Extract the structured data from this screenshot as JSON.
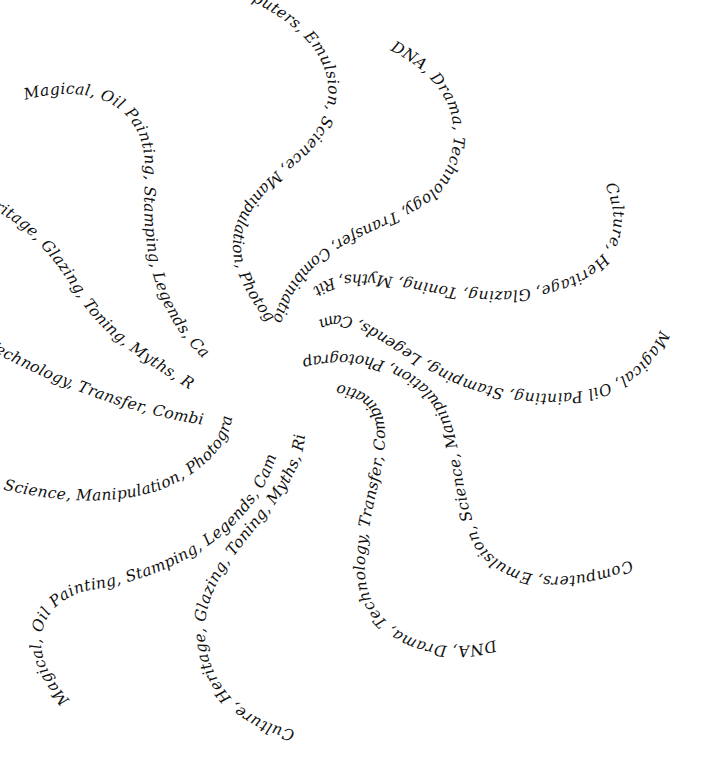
{
  "canvas": {
    "width": 710,
    "height": 758,
    "background": "#ffffff",
    "ink": "#111111"
  },
  "phrases": {
    "computers": "Computers, Emulsion, Science, Manipulation, Photographs, Cells",
    "dna": "DNA, Drama, Technology, Transfer, Combinations",
    "culture": "Culture, Heritage, Glazing, Toning, Myths, Rituals,",
    "magical": "Magical, Oil Painting, Stamping, Legends, Cameras"
  },
  "arms": [
    {
      "id": "top-computers",
      "text": "Computers, Emulsion, Science, Manipulation, Photographs, Cells"
    },
    {
      "id": "top-right-dna",
      "text": "DNA, Drama, Technology, Transfer, Combinations"
    },
    {
      "id": "right-culture",
      "text": "Culture, Heritage, Glazing, Toning, Myths, Rituals,"
    },
    {
      "id": "right-magical",
      "text": "Magical, Oil Painting, Stamping, Legends, Cameras"
    },
    {
      "id": "bottom-right-computers",
      "text": "Computers, Emulsion, Science, Manipulation, Photographs, Cells"
    },
    {
      "id": "bottom-dna",
      "text": "DNA, Drama, Technology, Transfer, Combinations"
    },
    {
      "id": "bottom-culture",
      "text": "Culture, Heritage, Glazing, Toning, Myths, Rituals,"
    },
    {
      "id": "bottom-left-magical",
      "text": "Magical, Oil Painting, Stamping, Legends, Cameras"
    },
    {
      "id": "left-computers",
      "text": "Computers, Emulsion, Science, Manipulation, Photographs, Cells"
    },
    {
      "id": "left-dna",
      "text": "DNA, Drama, Technology, Transfer, Combinations"
    },
    {
      "id": "left-culture",
      "text": "Culture, Heritage, Glazing, Toning, Myths, Rituals,"
    },
    {
      "id": "top-left-magical",
      "text": "Magical, Oil Painting, Stamping, Legends, Cameras"
    }
  ]
}
